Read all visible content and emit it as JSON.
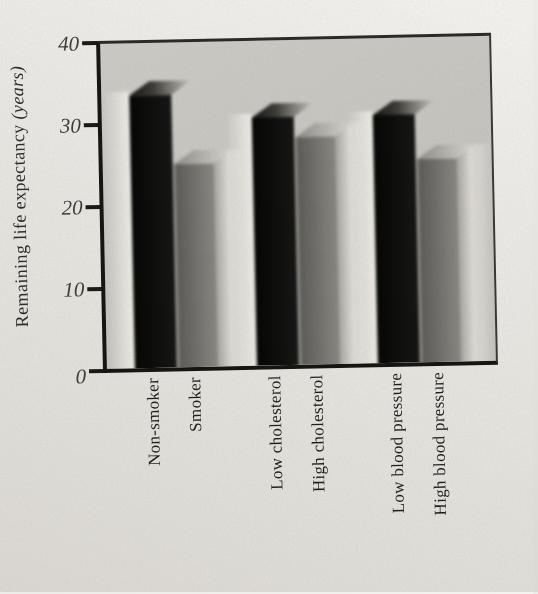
{
  "chart_data": {
    "type": "bar",
    "title": "",
    "ylabel": "Remaining life expectancy (years)",
    "ylabel_main": "Remaining life expectancy",
    "ylabel_unit": "(years)",
    "xlabel": "",
    "ylim": [
      0,
      40
    ],
    "yticks": [
      40,
      30,
      20,
      10,
      0
    ],
    "grid": false,
    "legend": false,
    "categories": [
      "Non-smoker",
      "Smoker",
      "Low cholesterol",
      "High cholesterol",
      "Low blood pressure",
      "High blood pressure"
    ],
    "values": [
      33.5,
      25,
      30.5,
      28,
      30.5,
      25
    ],
    "bar_shades": [
      "black",
      "gray",
      "black",
      "gray",
      "black",
      "gray"
    ],
    "pairs": [
      [
        "Non-smoker",
        "Smoker"
      ],
      [
        "Low cholesterol",
        "High cholesterol"
      ],
      [
        "Low blood pressure",
        "High blood pressure"
      ]
    ],
    "colors": {
      "black_bar": "#0d0d0b",
      "gray_bar": "#76746f",
      "bar_highlight": "#dedcd5",
      "plot_background": "#c7c5c0",
      "page_background": "#e9e7e2",
      "axis": "#1b1a17",
      "text": "#23221e"
    }
  }
}
